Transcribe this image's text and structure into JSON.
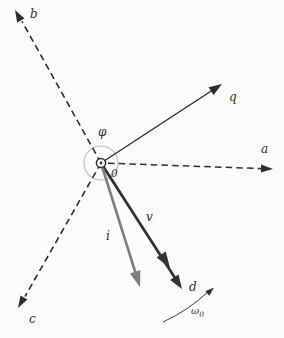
{
  "figure": {
    "labels": {
      "axis_a": "a",
      "axis_b": "b",
      "axis_c": "c",
      "axis_q": "q",
      "axis_d": "d",
      "vector_v": "v",
      "vector_i": "i",
      "angle_phi": "φ",
      "origin": "0",
      "omega_symbol": "ω",
      "omega_subscript": "0"
    },
    "colors": {
      "background": "#fbfbfb",
      "ink": "#2e2e2e",
      "vector_v": "#333333",
      "vector_i": "#7e7e7e",
      "angle_circle": "#bdbdbd",
      "omega_arc": "#3f3f3f"
    }
  }
}
